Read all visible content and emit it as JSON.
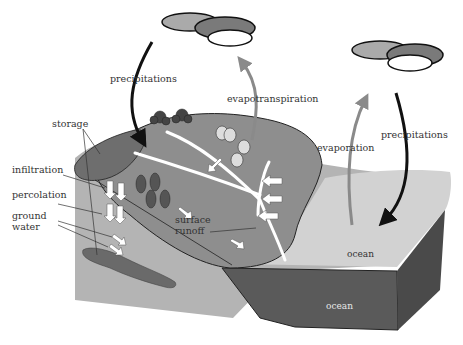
{
  "diagram": {
    "labels": {
      "precipitations_left": "precipitations",
      "evapotranspiration": "evapotranspiration",
      "evaporation": "evaporation",
      "precipitations_right": "precipitations",
      "storage": "storage",
      "infiltration": "infiltration",
      "percolation": "percolation",
      "ground_water_line1": "ground",
      "ground_water_line2": "water",
      "surface_runoff_line1": "surface",
      "surface_runoff_line2": "runoff",
      "ocean_surface": "ocean",
      "ocean_depth": "ocean"
    },
    "colors": {
      "background": "#ffffff",
      "terrain_light": "#b4b4b4",
      "land_hill": "#8e8e8e",
      "storage_lake": "#6e6e6e",
      "ground_water": "#6a6a6a",
      "ocean_surface": "#d2d2d2",
      "ocean_front": "#5a5a5a",
      "ocean_side": "#4a4a4a",
      "precipitation_arrow": "#111111",
      "evaporation_arrow": "#8a8a8a",
      "river": "#ffffff",
      "cloud_light": "#aaaaaa",
      "cloud_dark": "#7a7a7a",
      "cloud_white": "#ffffff"
    }
  }
}
